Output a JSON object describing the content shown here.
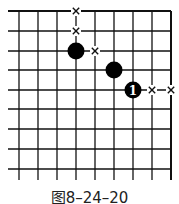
{
  "diagram": {
    "type": "go-board-fragment",
    "grid": {
      "columns_x": [
        19,
        38,
        57,
        76,
        95,
        114,
        133,
        152,
        171
      ],
      "rows_y": [
        11,
        31,
        51,
        70,
        90,
        109,
        129,
        149,
        169
      ],
      "left_open_x": 8,
      "bottom_open_y": 180,
      "top_edge": true,
      "right_edge": true
    },
    "stones": [
      {
        "color": "black",
        "x": 76,
        "y": 51,
        "label": ""
      },
      {
        "color": "black",
        "x": 114,
        "y": 70,
        "label": ""
      },
      {
        "color": "black",
        "x": 133,
        "y": 90,
        "label": "1"
      }
    ],
    "marks": [
      {
        "type": "x",
        "x": 76,
        "y": 11
      },
      {
        "type": "x",
        "x": 76,
        "y": 31
      },
      {
        "type": "x",
        "x": 95,
        "y": 51
      },
      {
        "type": "x",
        "x": 152,
        "y": 90
      },
      {
        "type": "x",
        "x": 171,
        "y": 90
      }
    ]
  },
  "caption": "图8–24–20"
}
